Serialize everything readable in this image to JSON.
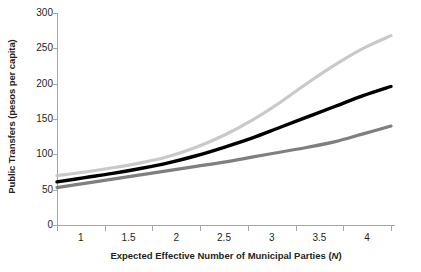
{
  "chart_data": {
    "type": "line",
    "title": "",
    "subtitle": "",
    "xlabel": "Expected Effective Number of Municipal Parties (N)",
    "xlabel_plain": "Expected Effective Number of Municipal Parties",
    "xlabel_italic_symbol": "N",
    "ylabel": "Public Transfers (pesos per capita)",
    "xlim": [
      1,
      4
    ],
    "ylim": [
      0,
      300
    ],
    "xticks": [
      1,
      1.5,
      2,
      2.5,
      3,
      3.5,
      4
    ],
    "xticklabels": [
      "1",
      "1.5",
      "2",
      "2.5",
      "3",
      "3.5",
      "4"
    ],
    "yticks": [
      0,
      50,
      100,
      150,
      200,
      250,
      300
    ],
    "yticklabels": [
      "0",
      "50",
      "100",
      "150",
      "200",
      "250",
      "300"
    ],
    "grid": false,
    "legend": "none",
    "x": [
      1,
      1.25,
      1.5,
      1.75,
      2,
      2.25,
      2.5,
      2.75,
      3,
      3.25,
      3.5,
      3.75,
      4
    ],
    "series": [
      {
        "name": "upper-curve",
        "color": "#c9c9c9",
        "width": 3.2,
        "values": [
          70,
          75,
          81,
          88,
          97,
          110,
          127,
          148,
          173,
          201,
          227,
          250,
          268
        ]
      },
      {
        "name": "middle-curve",
        "color": "#000000",
        "width": 3.4,
        "values": [
          61,
          67,
          73,
          80,
          88,
          98,
          110,
          123,
          138,
          153,
          168,
          183,
          196
        ]
      },
      {
        "name": "lower-curve",
        "color": "#7f7f7f",
        "width": 3.2,
        "values": [
          53,
          59,
          65,
          71,
          77,
          83,
          89,
          96,
          103,
          110,
          118,
          129,
          140
        ]
      }
    ]
  },
  "axis_colors": {
    "axis_line": "#a6a6a6",
    "text": "#231f20",
    "background": "#ffffff"
  }
}
